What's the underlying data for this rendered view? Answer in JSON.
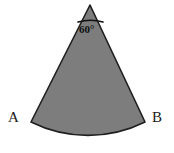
{
  "figure": {
    "background_color": "#ffffff",
    "fill_color": "#7d7d7d",
    "stroke_color": "#1f1f1f",
    "text_color": "#1a1a1a"
  },
  "labels": {
    "vertex_a": "A",
    "vertex_b": "B",
    "apex_angle": "60°"
  },
  "geometry": {
    "apex": {
      "x": 90,
      "y": 5
    },
    "point_a": {
      "x": 31,
      "y": 122
    },
    "point_b": {
      "x": 145,
      "y": 122
    },
    "arc_bottom": {
      "x": 88,
      "y": 137
    },
    "angle_mark_left": {
      "x": 78,
      "y": 22
    },
    "angle_mark_right": {
      "x": 103,
      "y": 22
    }
  }
}
